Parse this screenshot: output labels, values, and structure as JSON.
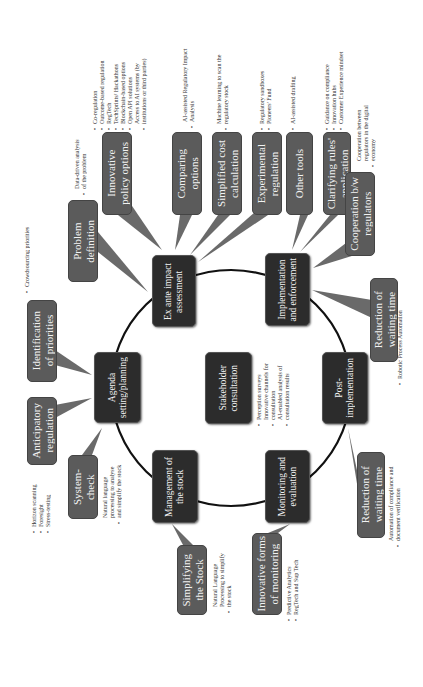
{
  "diagram": {
    "orientation": "rotated-90-ccw",
    "colors": {
      "main_box": "#2c2c2c",
      "callout_box": "#5b5b5b",
      "circle_line": "#111111",
      "text_light": "#f2f2f2",
      "note_text": "#333333"
    },
    "cycle_stages": [
      {
        "id": "ex-ante",
        "label": "Ex ante impact\nassessment"
      },
      {
        "id": "implementation",
        "label": "Implementation\nand enforcement"
      },
      {
        "id": "post-implementation",
        "label": "Post-\nimplementation"
      },
      {
        "id": "monitoring",
        "label": "Monitoring and\nevaluation"
      },
      {
        "id": "management",
        "label": "Management of\nthe stock"
      },
      {
        "id": "agenda",
        "label": "Agenda\nsetting/planning"
      }
    ],
    "center": {
      "label": "Stakeholder\nconsultation",
      "notes": [
        "Perception surveys",
        "Innovative channels for\nconsultation",
        "AI-enabled analysis of\nconsultation results"
      ]
    },
    "callouts": {
      "problem_definition": {
        "label": "Problem\ndefinition",
        "notes": [
          "Data-driven analysis\nof the problem"
        ]
      },
      "innovative_policy": {
        "label": "Innovative\npolicy options",
        "notes": [
          "Co-regulation",
          "Outcome-based regulation",
          "RegTech",
          "TechSprints/ Hackathons",
          "Blockchain-based options",
          "Open API solutions",
          "Access to AI systems (by\ninstitutions or third parties)"
        ]
      },
      "comparing_options": {
        "label": "Comparing\noptions",
        "notes": [
          "AI-assisted Regulatory Impact\nAnalysis"
        ]
      },
      "simplified_cost": {
        "label": "Simplified cost\ncalculation",
        "notes": [
          "Machine learning to scan the\nregulatory stock"
        ]
      },
      "experimental_regulation": {
        "label": "Experimental\nregulation",
        "notes": [
          "Regulatory sandboxes",
          "Pioneers' Fund"
        ]
      },
      "other_tools": {
        "label": "Other tools",
        "notes": [
          "AI-assisted drafting"
        ]
      },
      "clarifying_rules": {
        "label": "Clarifying rules'\napplication",
        "notes": [
          "Guidance on compliance",
          "Innovation hubs",
          "Customer Experience mindset"
        ]
      },
      "cooperation": {
        "label": "Cooperation b/w\nregulators",
        "notes": [
          "Cooperation between\nregulators in the digital\neconomy"
        ]
      },
      "reduction_top": {
        "label": "Reduction of\nwaiting time",
        "notes": [
          "Robotic Process Automation"
        ]
      },
      "identification_priorities": {
        "label": "Identification\nof priorities",
        "notes": [
          "Crowdsourcing priorities"
        ]
      },
      "anticipatory": {
        "label": "Anticipatory\nregulation",
        "notes": [
          "Horizon scanning",
          "Foresight",
          "Stress-testing"
        ]
      },
      "system_check": {
        "label": "System-\ncheck",
        "notes": [
          "Natural language\nprocessing to analyse\nand simplify the stock"
        ]
      },
      "simplifying_stock": {
        "label": "Simplifying\nthe Stock",
        "notes": [
          "Natural Language\nProcessing to simplify\nthe stock"
        ]
      },
      "innovative_monitoring": {
        "label": "Innovative forms\nof monitoring",
        "notes": [
          "Predictive Analytics",
          "RegTech and Sup Tech"
        ]
      },
      "reduction_bottom": {
        "label": "Reduction of\nwaiting time",
        "notes": [
          "Automation of compliance and\ndocument verification"
        ]
      }
    }
  }
}
